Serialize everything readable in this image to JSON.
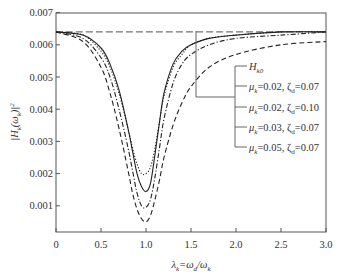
{
  "chart_data": {
    "type": "line",
    "title": "",
    "xlabel": "λ_k = ω_d / ω_k",
    "ylabel": "|H_k(ω_k)|^2",
    "xlim": [
      0,
      3.0
    ],
    "ylim": [
      0,
      0.007
    ],
    "grid": false,
    "legend_position": "right-middle (bracketed callout)",
    "x_ticks": [
      "0",
      "0.5",
      "1.0",
      "1.5",
      "2.0",
      "2.5",
      "3.0"
    ],
    "y_ticks": [
      "0.001",
      "0.002",
      "0.003",
      "0.004",
      "0.005",
      "0.006",
      "0.007"
    ],
    "series": [
      {
        "name": "H_k0",
        "style": "long-dash",
        "x": [
          0,
          3.0
        ],
        "y": [
          0.0064,
          0.0064
        ]
      },
      {
        "name": "μ_k=0.02, ζ_d=0.07",
        "style": "solid",
        "x": [
          0,
          0.3,
          0.5,
          0.6,
          0.7,
          0.8,
          0.85,
          0.9,
          0.95,
          1.0,
          1.05,
          1.1,
          1.15,
          1.2,
          1.3,
          1.4,
          1.5,
          1.7,
          2.0,
          2.5,
          3.0
        ],
        "y": [
          0.0064,
          0.0063,
          0.0059,
          0.0054,
          0.0046,
          0.0034,
          0.0027,
          0.002,
          0.0016,
          0.00144,
          0.0017,
          0.0026,
          0.0036,
          0.0045,
          0.0054,
          0.0058,
          0.006,
          0.0062,
          0.0063,
          0.0064,
          0.0064
        ]
      },
      {
        "name": "μ_k=0.02, ζ_d=0.10",
        "style": "dotted",
        "x": [
          0,
          0.3,
          0.5,
          0.6,
          0.7,
          0.8,
          0.85,
          0.9,
          0.95,
          1.0,
          1.05,
          1.1,
          1.15,
          1.2,
          1.3,
          1.4,
          1.5,
          1.7,
          2.0,
          2.5,
          3.0
        ],
        "y": [
          0.0064,
          0.0063,
          0.0058,
          0.0053,
          0.0045,
          0.0034,
          0.0028,
          0.0023,
          0.002,
          0.002,
          0.0022,
          0.0028,
          0.0036,
          0.0044,
          0.0053,
          0.0057,
          0.006,
          0.0062,
          0.0063,
          0.0064,
          0.0064
        ]
      },
      {
        "name": "μ_k=0.03, ζ_d=0.07",
        "style": "dash-dot",
        "x": [
          0,
          0.3,
          0.5,
          0.6,
          0.7,
          0.8,
          0.85,
          0.9,
          0.95,
          1.0,
          1.05,
          1.1,
          1.15,
          1.2,
          1.3,
          1.4,
          1.5,
          1.7,
          2.0,
          2.5,
          3.0
        ],
        "y": [
          0.0064,
          0.0062,
          0.0056,
          0.005,
          0.004,
          0.0028,
          0.0021,
          0.0014,
          0.001,
          0.00095,
          0.0012,
          0.0019,
          0.0028,
          0.0037,
          0.0048,
          0.0054,
          0.0057,
          0.006,
          0.0062,
          0.0063,
          0.0064
        ]
      },
      {
        "name": "μ_k=0.05, ζ_d=0.07",
        "style": "dashed",
        "x": [
          0,
          0.3,
          0.5,
          0.6,
          0.7,
          0.8,
          0.85,
          0.9,
          0.95,
          1.0,
          1.05,
          1.1,
          1.15,
          1.2,
          1.3,
          1.4,
          1.5,
          1.7,
          2.0,
          2.5,
          3.0
        ],
        "y": [
          0.0064,
          0.0061,
          0.0053,
          0.0045,
          0.0034,
          0.0021,
          0.0014,
          0.0009,
          0.0006,
          0.0005,
          0.0007,
          0.0012,
          0.0018,
          0.0025,
          0.0035,
          0.0042,
          0.0047,
          0.0053,
          0.0057,
          0.006,
          0.0061
        ]
      }
    ]
  },
  "legend": {
    "items": [
      {
        "label_main": "H",
        "label_sub": "k0",
        "rest": ""
      },
      {
        "label_main": "μ",
        "label_sub": "k",
        "rest": "=0.02, ζ",
        "sub2": "d",
        "rest2": "=0.07"
      },
      {
        "label_main": "μ",
        "label_sub": "k",
        "rest": "=0.02, ζ",
        "sub2": "d",
        "rest2": "=0.10"
      },
      {
        "label_main": "μ",
        "label_sub": "k",
        "rest": "=0.03, ζ",
        "sub2": "d",
        "rest2": "=0.07"
      },
      {
        "label_main": "μ",
        "label_sub": "k",
        "rest": "=0.05, ζ",
        "sub2": "d",
        "rest2": "=0.07"
      }
    ]
  },
  "axes": {
    "xlabel_parts": {
      "lambda": "λ",
      "lambda_sub": "k",
      "eq": "=ω",
      "d_sub": "d",
      "slash": "/ω",
      "k_sub": "k"
    },
    "ylabel_parts": {
      "bar1": "|H",
      "sub": "k",
      "arg": "(ω",
      "arg_sub": "k",
      "close": ")|",
      "sup": "2"
    }
  }
}
